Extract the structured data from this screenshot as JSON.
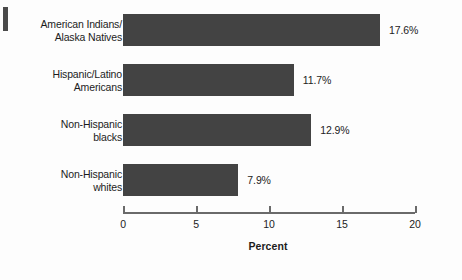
{
  "chart_data": {
    "type": "bar",
    "orientation": "horizontal",
    "title": "",
    "xlabel": "Percent",
    "ylabel": "",
    "xlim": [
      0,
      20
    ],
    "xticks": [
      0,
      5,
      10,
      15,
      20
    ],
    "xtick_labels": [
      "0",
      "5",
      "10",
      "15",
      "20"
    ],
    "grid": false,
    "legend": false,
    "bar_color": "#434343",
    "categories": [
      "American Indians/\nAlaska Natives",
      "Hispanic/Latino\nAmericans",
      "Non-Hispanic\nblacks",
      "Non-Hispanic\nwhites"
    ],
    "values": [
      17.6,
      11.7,
      12.9,
      7.9
    ],
    "value_labels": [
      "17.6%",
      "11.7%",
      "12.9%",
      "7.9%"
    ]
  },
  "axis": {
    "title": "Percent",
    "ticks": [
      {
        "value": 0,
        "label": "0"
      },
      {
        "value": 5,
        "label": "5"
      },
      {
        "value": 10,
        "label": "10"
      },
      {
        "value": 15,
        "label": "15"
      },
      {
        "value": 20,
        "label": "20"
      }
    ]
  },
  "bars": [
    {
      "category": "American Indians/\nAlaska Natives",
      "value": 17.6,
      "label": "17.6%"
    },
    {
      "category": "Hispanic/Latino\nAmericans",
      "value": 11.7,
      "label": "11.7%"
    },
    {
      "category": "Non-Hispanic\nblacks",
      "value": 12.9,
      "label": "12.9%"
    },
    {
      "category": "Non-Hispanic\nwhites",
      "value": 7.9,
      "label": "7.9%"
    }
  ],
  "colors": {
    "bar": "#434343",
    "axis": "#6a6a6a",
    "text": "#1c1c1c",
    "background": "#fdfdfd"
  }
}
